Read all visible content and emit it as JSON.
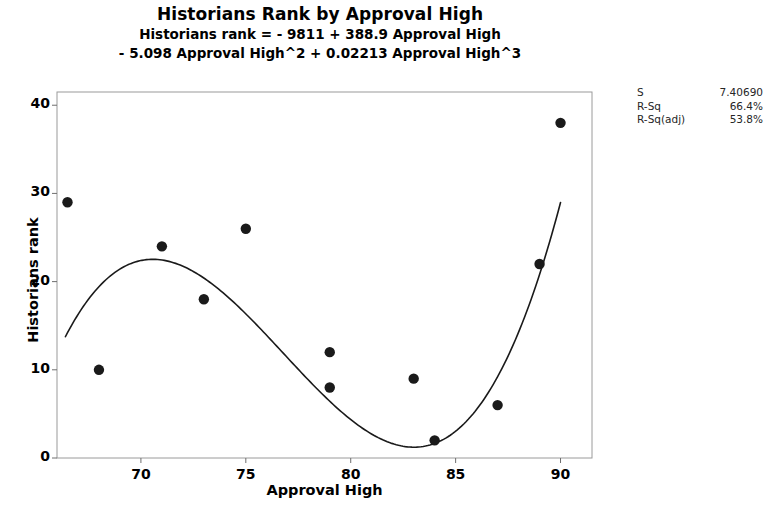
{
  "chart_data": {
    "type": "scatter",
    "title": "Historians Rank by Approval High",
    "subtitle_line1": "Historians rank = - 9811 + 388.9 Approval High",
    "subtitle_line2": "- 5.098 Approval High^2 + 0.02213 Approval High^3",
    "xlabel": "Approval High",
    "ylabel": "Historians rank",
    "xlim": [
      66,
      91.5
    ],
    "ylim": [
      0,
      41.5
    ],
    "xticks": [
      70,
      75,
      80,
      85,
      90
    ],
    "yticks": [
      0,
      10,
      20,
      30,
      40
    ],
    "grid": false,
    "legend": false,
    "marker_color": "#1a1a1a",
    "line_color": "#1a1a1a",
    "points": [
      {
        "x": 66.5,
        "y": 29
      },
      {
        "x": 68,
        "y": 10
      },
      {
        "x": 71,
        "y": 24
      },
      {
        "x": 73,
        "y": 18
      },
      {
        "x": 75,
        "y": 26
      },
      {
        "x": 79,
        "y": 12
      },
      {
        "x": 79,
        "y": 8
      },
      {
        "x": 83,
        "y": 9
      },
      {
        "x": 84,
        "y": 2
      },
      {
        "x": 87,
        "y": 6
      },
      {
        "x": 89,
        "y": 22
      },
      {
        "x": 90,
        "y": 38
      }
    ],
    "fit": {
      "type": "cubic",
      "equation": "Historians rank = - 9811 + 388.9 Approval High - 5.098 Approval High^2 + 0.02213 Approval High^3",
      "intercept": -9811,
      "b1": 388.9,
      "b2": -5.098,
      "b3": 0.02213,
      "x_start": 66.4,
      "x_end": 90.0
    },
    "stats": [
      {
        "label": "S",
        "value": "7.40690"
      },
      {
        "label": "R-Sq",
        "value": "66.4%"
      },
      {
        "label": "R-Sq(adj)",
        "value": "53.8%"
      }
    ]
  }
}
